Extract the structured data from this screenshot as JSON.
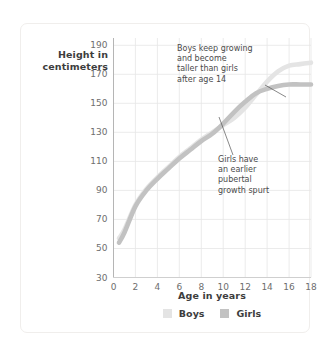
{
  "chart_data": {
    "type": "line",
    "title": "",
    "xlabel": "Age in years",
    "ylabel": "Height in\ncentimeters",
    "xlim": [
      0,
      18
    ],
    "ylim": [
      30,
      195
    ],
    "xticks": [
      0,
      2,
      4,
      6,
      8,
      10,
      12,
      14,
      16,
      18
    ],
    "yticks": [
      30,
      50,
      70,
      90,
      110,
      130,
      150,
      170,
      190
    ],
    "grid": true,
    "legend_position": "bottom-center",
    "series": [
      {
        "name": "Boys",
        "color": "#e4e4e4",
        "x": [
          0.5,
          1,
          2,
          3,
          4,
          5,
          6,
          7,
          8,
          9,
          10,
          11,
          12,
          13,
          14,
          15,
          16,
          17,
          18
        ],
        "values": [
          57,
          63,
          80,
          91,
          99,
          106,
          113,
          119,
          125,
          130,
          135,
          140,
          147,
          156,
          165,
          172,
          176,
          177,
          178
        ]
      },
      {
        "name": "Girls",
        "color": "#c2c2c2",
        "x": [
          0.5,
          1,
          2,
          3,
          4,
          5,
          6,
          7,
          8,
          9,
          10,
          11,
          12,
          13,
          14,
          15,
          16,
          17,
          18
        ],
        "values": [
          54,
          61,
          79,
          90,
          98,
          105,
          112,
          118,
          124,
          129,
          136,
          144,
          151,
          157,
          160,
          162,
          163,
          163,
          163
        ]
      }
    ],
    "annotations": [
      {
        "name": "boys-annotation",
        "text": "Boys keep growing\nand become\ntaller than girls\nafter age 14",
        "leader_from": [
          265,
          85
        ],
        "leader_to": [
          286,
          97
        ]
      },
      {
        "name": "girls-annotation",
        "text": "Girls have\nan earlier\npubertal\ngrowth spurt",
        "leader_from": [
          233,
          155
        ],
        "leader_to": [
          219,
          117
        ]
      }
    ]
  },
  "legend": {
    "items": [
      {
        "label": "Boys",
        "color": "#e4e4e4"
      },
      {
        "label": "Girls",
        "color": "#c2c2c2"
      }
    ]
  },
  "axes": {
    "y_title": "Height in\ncentimeters",
    "x_title": "Age in years"
  },
  "colors": {
    "background": "#ffffff",
    "card_border": "#f0eeec",
    "grid": "#e6e6e6",
    "axis": "#b5b5b5",
    "tick_text": "#6e6e6e",
    "title_text": "#3d3d3d",
    "annotation_text": "#4a4a4a",
    "boys": "#e4e4e4",
    "girls": "#c2c2c2"
  }
}
